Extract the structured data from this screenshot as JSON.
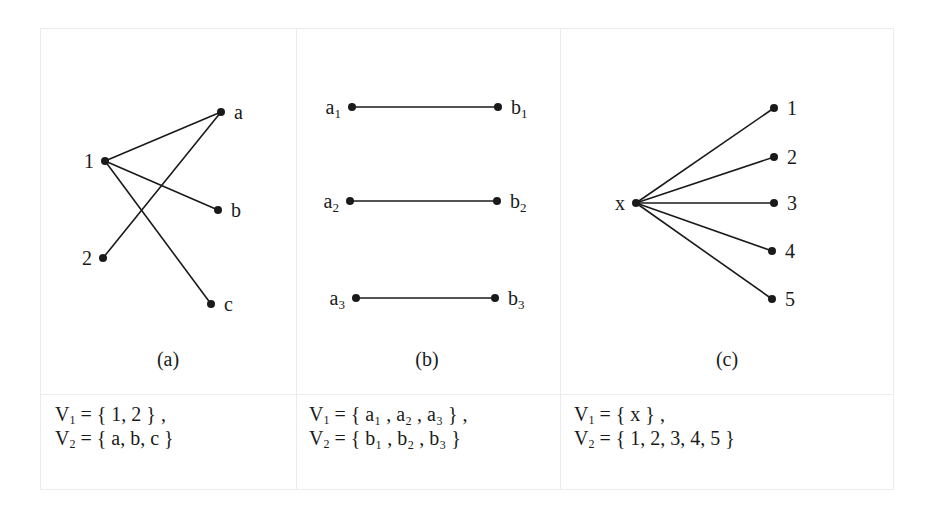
{
  "figure": {
    "panels": [
      {
        "id": "a",
        "caption": "(a)",
        "nodes": [
          {
            "id": "1",
            "label": "1",
            "x": 105,
            "y": 161,
            "label_side": "left"
          },
          {
            "id": "2",
            "label": "2",
            "x": 103,
            "y": 258,
            "label_side": "left"
          },
          {
            "id": "a",
            "label": "a",
            "x": 221,
            "y": 112,
            "label_side": "right"
          },
          {
            "id": "b",
            "label": "b",
            "x": 218,
            "y": 210,
            "label_side": "right"
          },
          {
            "id": "c",
            "label": "c",
            "x": 211,
            "y": 304,
            "label_side": "right"
          }
        ],
        "edges": [
          [
            "1",
            "a"
          ],
          [
            "1",
            "b"
          ],
          [
            "1",
            "c"
          ],
          [
            "2",
            "a"
          ]
        ],
        "sets": {
          "v1": {
            "name": "V",
            "sub": "1",
            "eq": " =  { 1, 2 } ,"
          },
          "v2": {
            "name": "V",
            "sub": "2",
            "eq": " =  { a, b, c }"
          }
        }
      },
      {
        "id": "b",
        "caption": "(b)",
        "nodes": [
          {
            "id": "a1",
            "label": "a",
            "sub": "1",
            "x": 352,
            "y": 107,
            "label_side": "left"
          },
          {
            "id": "a2",
            "label": "a",
            "sub": "2",
            "x": 350,
            "y": 201,
            "label_side": "left"
          },
          {
            "id": "a3",
            "label": "a",
            "sub": "3",
            "x": 356,
            "y": 298,
            "label_side": "left"
          },
          {
            "id": "b1",
            "label": "b",
            "sub": "1",
            "x": 498,
            "y": 107,
            "label_side": "right"
          },
          {
            "id": "b2",
            "label": "b",
            "sub": "2",
            "x": 497,
            "y": 201,
            "label_side": "right"
          },
          {
            "id": "b3",
            "label": "b",
            "sub": "3",
            "x": 495,
            "y": 298,
            "label_side": "right"
          }
        ],
        "edges": [
          [
            "a1",
            "b1"
          ],
          [
            "a2",
            "b2"
          ],
          [
            "a3",
            "b3"
          ]
        ],
        "sets": {
          "v1": {
            "name": "V",
            "sub": "1",
            "eq": " =  { a₁ , a₂ , a₃ } ,"
          },
          "v2": {
            "name": "V",
            "sub": "2",
            "eq": " =  { b₁ , b₂ , b₃ }"
          }
        }
      },
      {
        "id": "c",
        "caption": "(c)",
        "nodes": [
          {
            "id": "x",
            "label": "x",
            "x": 636,
            "y": 203,
            "label_side": "left"
          },
          {
            "id": "1",
            "label": "1",
            "x": 774,
            "y": 108,
            "label_side": "right"
          },
          {
            "id": "2",
            "label": "2",
            "x": 774,
            "y": 157,
            "label_side": "right"
          },
          {
            "id": "3",
            "label": "3",
            "x": 774,
            "y": 203,
            "label_side": "right"
          },
          {
            "id": "4",
            "label": "4",
            "x": 772,
            "y": 251,
            "label_side": "right"
          },
          {
            "id": "5",
            "label": "5",
            "x": 772,
            "y": 299,
            "label_side": "right"
          }
        ],
        "edges": [
          [
            "x",
            "1"
          ],
          [
            "x",
            "2"
          ],
          [
            "x",
            "3"
          ],
          [
            "x",
            "4"
          ],
          [
            "x",
            "5"
          ]
        ],
        "sets": {
          "v1": {
            "name": "V",
            "sub": "1",
            "eq": " =  {  x } ,"
          },
          "v2": {
            "name": "V",
            "sub": "2",
            "eq": " =  { 1, 2, 3, 4, 5 }"
          }
        }
      }
    ]
  },
  "style": {
    "ink": "#1a1a1a",
    "grid": "#ececec"
  }
}
